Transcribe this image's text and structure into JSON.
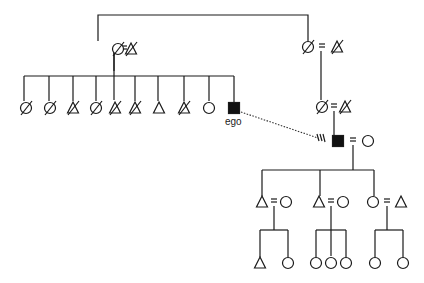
{
  "diagram": {
    "type": "kinship-chart",
    "ego_label": "ego",
    "colors": {
      "stroke": "#1a1a1a",
      "fill_ego": "#111111",
      "background": "#ffffff"
    },
    "legend_symbols": {
      "triangle": "male",
      "circle": "female",
      "square-filled": "ego",
      "slash": "deceased"
    },
    "individuals": [
      {
        "id": "gp1_f",
        "symbol": "circle",
        "deceased": true,
        "x": 118,
        "y": 49
      },
      {
        "id": "gp1_m",
        "symbol": "triangle",
        "deceased": true,
        "x": 131,
        "y": 49
      },
      {
        "id": "gp2_f",
        "symbol": "circle",
        "deceased": true,
        "x": 308,
        "y": 47
      },
      {
        "id": "gp2_m",
        "symbol": "triangle",
        "deceased": true,
        "x": 337,
        "y": 47
      },
      {
        "id": "s1",
        "symbol": "circle",
        "deceased": true,
        "x": 26,
        "y": 108
      },
      {
        "id": "s2",
        "symbol": "circle",
        "deceased": true,
        "x": 50,
        "y": 108
      },
      {
        "id": "s3",
        "symbol": "triangle",
        "deceased": true,
        "x": 73,
        "y": 108
      },
      {
        "id": "s4",
        "symbol": "circle",
        "deceased": true,
        "x": 96,
        "y": 108
      },
      {
        "id": "s5",
        "symbol": "triangle",
        "deceased": true,
        "x": 115,
        "y": 108
      },
      {
        "id": "s6",
        "symbol": "triangle",
        "deceased": true,
        "x": 135,
        "y": 108
      },
      {
        "id": "s7",
        "symbol": "triangle",
        "deceased": false,
        "x": 159,
        "y": 108
      },
      {
        "id": "s8",
        "symbol": "triangle",
        "deceased": true,
        "x": 184,
        "y": 108
      },
      {
        "id": "s9",
        "symbol": "circle",
        "deceased": false,
        "x": 209,
        "y": 108
      },
      {
        "id": "ego",
        "symbol": "square-filled",
        "deceased": false,
        "x": 234,
        "y": 108,
        "label": "ego"
      },
      {
        "id": "p_f",
        "symbol": "circle",
        "deceased": true,
        "x": 322,
        "y": 107
      },
      {
        "id": "p_m",
        "symbol": "triangle",
        "deceased": true,
        "x": 345,
        "y": 107
      },
      {
        "id": "ego2",
        "symbol": "square-filled",
        "deceased": false,
        "x": 338,
        "y": 141
      },
      {
        "id": "ego2_w",
        "symbol": "circle",
        "deceased": false,
        "x": 368,
        "y": 141
      },
      {
        "id": "c1",
        "symbol": "triangle",
        "deceased": false,
        "x": 262,
        "y": 202
      },
      {
        "id": "c1_w",
        "symbol": "circle",
        "deceased": false,
        "x": 286,
        "y": 202
      },
      {
        "id": "c2",
        "symbol": "triangle",
        "deceased": false,
        "x": 319,
        "y": 202
      },
      {
        "id": "c2_w",
        "symbol": "circle",
        "deceased": false,
        "x": 343,
        "y": 202
      },
      {
        "id": "c3",
        "symbol": "circle",
        "deceased": false,
        "x": 373,
        "y": 202
      },
      {
        "id": "c3_h",
        "symbol": "triangle",
        "deceased": false,
        "x": 401,
        "y": 202
      },
      {
        "id": "g1",
        "symbol": "triangle",
        "deceased": false,
        "x": 260,
        "y": 263
      },
      {
        "id": "g2",
        "symbol": "circle",
        "deceased": false,
        "x": 288,
        "y": 263
      },
      {
        "id": "g3",
        "symbol": "circle",
        "deceased": false,
        "x": 316,
        "y": 263
      },
      {
        "id": "g4",
        "symbol": "circle",
        "deceased": false,
        "x": 331,
        "y": 263
      },
      {
        "id": "g5",
        "symbol": "circle",
        "deceased": false,
        "x": 346,
        "y": 263
      },
      {
        "id": "g6",
        "symbol": "circle",
        "deceased": false,
        "x": 375,
        "y": 263
      },
      {
        "id": "g7",
        "symbol": "circle",
        "deceased": false,
        "x": 403,
        "y": 263
      }
    ],
    "marriages": [
      {
        "x": 124,
        "y": 49
      },
      {
        "x": 322,
        "y": 47
      },
      {
        "x": 334,
        "y": 107
      },
      {
        "x": 353,
        "y": 141
      },
      {
        "x": 274,
        "y": 202
      },
      {
        "x": 331,
        "y": 202
      },
      {
        "x": 387,
        "y": 202
      }
    ]
  }
}
